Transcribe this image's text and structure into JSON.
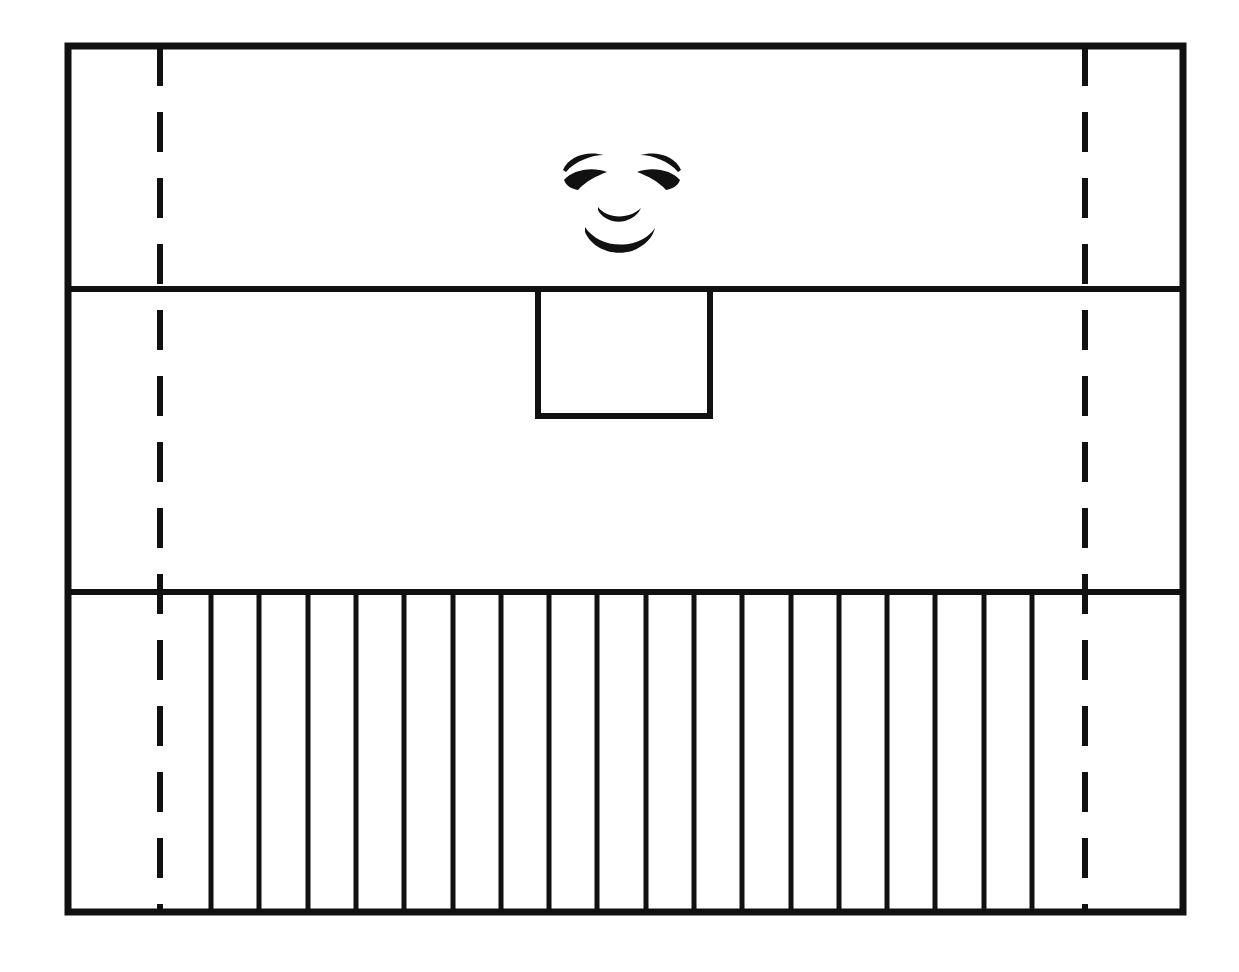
{
  "document": {
    "title": "Line drawing of a paneled facade with a face",
    "background_color": "#ffffff",
    "ink_color": "#111111",
    "width": 1239,
    "height": 972
  },
  "figure": {
    "caption": "",
    "style": "hand-inked black line drawing on white paper"
  },
  "outer_frame": {
    "label": "outer-rectangle",
    "x": 68,
    "y": 46,
    "width": 1115,
    "height": 866,
    "stroke_width": 7,
    "stroke_color": "#111111",
    "fill": "none"
  },
  "horizontal_dividers": [
    {
      "label": "upper-divider",
      "y": 289,
      "x_start": 68,
      "x_end": 1183,
      "stroke_width": 6
    },
    {
      "label": "lower-divider",
      "y": 592,
      "x_start": 68,
      "x_end": 1183,
      "stroke_width": 6
    }
  ],
  "dashed_lines": [
    {
      "label": "left-dashed-line",
      "x": 160,
      "y_start": 46,
      "y_end": 912,
      "stroke_width": 6,
      "dash_length": 40,
      "gap_length": 26
    },
    {
      "label": "right-dashed-line",
      "x": 1085,
      "y_start": 46,
      "y_end": 912,
      "stroke_width": 6,
      "dash_length": 40,
      "gap_length": 26
    }
  ],
  "inner_box": {
    "label": "center-square-panel",
    "x": 538,
    "y": 289,
    "width": 172,
    "height": 127,
    "stroke_width": 6,
    "fill": "none"
  },
  "slats": {
    "label": "vertical-slat-group",
    "count": 18,
    "first_x": 211,
    "spacing": 48.3,
    "y_start": 592,
    "y_end": 912,
    "stroke_width": 5,
    "positions": [
      211,
      259,
      308,
      356,
      404,
      453,
      501,
      549,
      597,
      646,
      694,
      742,
      791,
      839,
      887,
      935,
      984,
      1032
    ]
  },
  "face": {
    "label": "drawn-face",
    "center_x": 620,
    "center_y": 195,
    "parts": [
      {
        "name": "left-eyebrow",
        "cx": 585,
        "cy": 165
      },
      {
        "name": "right-eyebrow",
        "cx": 660,
        "cy": 165
      },
      {
        "name": "left-eye",
        "cx": 585,
        "cy": 182
      },
      {
        "name": "right-eye",
        "cx": 660,
        "cy": 182
      },
      {
        "name": "nose",
        "cx": 620,
        "cy": 212
      },
      {
        "name": "mouth",
        "cx": 620,
        "cy": 232
      }
    ]
  },
  "regions": [
    {
      "name": "upper-band",
      "description": "top horizontal band containing the face"
    },
    {
      "name": "middle-band",
      "description": "middle horizontal band containing the center square panel"
    },
    {
      "name": "lower-band",
      "description": "bottom horizontal band filled with vertical slats"
    }
  ]
}
